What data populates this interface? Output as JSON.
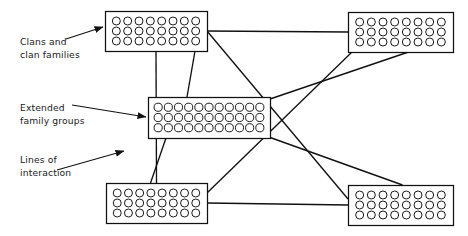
{
  "figure": {
    "type": "node-link diagram",
    "background_color": "#ffffff",
    "line_color": "#111111",
    "box_fill": "#ffffff",
    "box_stroke": "#111111",
    "circle_stroke": "#111111",
    "text_color": "#1a1a1a"
  },
  "labels": {
    "clans": {
      "line1": "Clans and",
      "line2": "clan families"
    },
    "extended": {
      "line1": "Extended",
      "line2": "family groups"
    },
    "lines": {
      "line1": "Lines of",
      "line2": "interaction"
    }
  },
  "groups": [
    {
      "id": "top-left",
      "name": "clan-group-top-left",
      "x": 105,
      "y": 11,
      "width": 102,
      "height": 40,
      "rows": 3,
      "cols": 8,
      "circle_count": 24
    },
    {
      "id": "top-right",
      "name": "clan-group-top-right",
      "x": 348,
      "y": 12,
      "width": 105,
      "height": 40,
      "rows": 3,
      "cols": 8,
      "circle_count": 24
    },
    {
      "id": "middle",
      "name": "extended-family-group-middle",
      "x": 148,
      "y": 97,
      "width": 122,
      "height": 41,
      "rows": 3,
      "cols": 11,
      "circle_count": 33
    },
    {
      "id": "bottom-left",
      "name": "clan-group-bottom-left",
      "x": 106,
      "y": 183,
      "width": 101,
      "height": 40,
      "rows": 3,
      "cols": 8,
      "circle_count": 24
    },
    {
      "id": "bottom-right",
      "name": "clan-group-bottom-right",
      "x": 348,
      "y": 185,
      "width": 105,
      "height": 40,
      "rows": 3,
      "cols": 8,
      "circle_count": 24
    }
  ],
  "connections": [
    {
      "name": "link-top-left-to-top-right",
      "from": "top-left",
      "to": "top-right"
    },
    {
      "name": "link-top-left-to-bottom-left",
      "from": "top-left",
      "to": "bottom-left"
    },
    {
      "name": "link-top-left-to-middle",
      "from": "top-left",
      "to": "middle"
    },
    {
      "name": "link-top-left-to-bottom-right",
      "from": "top-left",
      "to": "bottom-right"
    },
    {
      "name": "link-top-right-to-middle",
      "from": "top-right",
      "to": "middle"
    },
    {
      "name": "link-top-right-to-bottom-left",
      "from": "top-right",
      "to": "bottom-left"
    },
    {
      "name": "link-middle-to-bottom-left",
      "from": "middle",
      "to": "bottom-left"
    },
    {
      "name": "link-middle-to-bottom-right",
      "from": "middle",
      "to": "bottom-right"
    },
    {
      "name": "link-bottom-left-to-bottom-right",
      "from": "bottom-left",
      "to": "bottom-right"
    }
  ],
  "annotations": [
    {
      "name": "callout-clans",
      "target": "top-left",
      "leader_from": [
        66,
        39
      ],
      "leader_to": [
        103,
        27
      ],
      "arrow": true
    },
    {
      "name": "callout-extended-family",
      "target": "middle",
      "leader_from": [
        72,
        105
      ],
      "leader_to": [
        146,
        117
      ],
      "arrow": true
    },
    {
      "name": "callout-lines-of-interaction",
      "target": "vertical-line",
      "leader_from": [
        57,
        170
      ],
      "leader_to": [
        124,
        151
      ],
      "arrow": true
    }
  ]
}
